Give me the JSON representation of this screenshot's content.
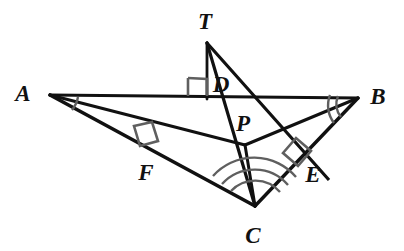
{
  "figure": {
    "type": "geometry-diagram",
    "background_color": "#ffffff",
    "stroke_color": "#111111",
    "mark_color": "#5a5a5a",
    "points": {
      "A": {
        "label": "A",
        "x": 50,
        "y": 95,
        "label_x": 23,
        "label_y": 101
      },
      "B": {
        "label": "B",
        "x": 358,
        "y": 98,
        "label_x": 368,
        "label_y": 104
      },
      "C": {
        "label": "C",
        "x": 255,
        "y": 206,
        "label_x": 245,
        "label_y": 240
      },
      "T": {
        "label": "T",
        "x": 207,
        "y": 43,
        "label_x": 198,
        "label_y": 27
      },
      "D": {
        "label": "D",
        "x": 207,
        "y": 96,
        "label_x": 213,
        "label_y": 91
      },
      "E": {
        "label": "E",
        "x": 305,
        "y": 154,
        "label_x": 305,
        "label_y": 181
      },
      "F": {
        "label": "F",
        "x": 153,
        "y": 151,
        "label_x": 137,
        "label_y": 179
      },
      "P": {
        "label": "P",
        "x": 245,
        "y": 145,
        "label_x": 234,
        "label_y": 131
      }
    },
    "segments": [
      {
        "name": "A-B",
        "from": "A",
        "to": "B"
      },
      {
        "name": "A-C",
        "from": "A",
        "to": "C"
      },
      {
        "name": "B-C",
        "from": "B",
        "to": "C"
      },
      {
        "name": "A-P",
        "from": "A",
        "to": "P"
      },
      {
        "name": "B-P",
        "from": "B",
        "to": "P"
      },
      {
        "name": "C-P",
        "from": "C",
        "to": "P"
      },
      {
        "name": "T-D",
        "from": "T",
        "to": "D"
      },
      {
        "name": "T-F-C",
        "from": "T",
        "to": "C",
        "through": "F"
      },
      {
        "name": "T-E-C",
        "from": "T",
        "to": "C",
        "through": "E"
      }
    ],
    "angle_marks": [
      {
        "name": "angle-mark-A",
        "vertex": "A",
        "arcs": 1
      },
      {
        "name": "angle-mark-B",
        "vertex": "B",
        "arcs": 2
      },
      {
        "name": "angle-mark-C",
        "vertex": "C",
        "arcs": 3
      }
    ],
    "right_angle_marks": [
      {
        "name": "right-angle-D",
        "at": "D"
      },
      {
        "name": "right-angle-F",
        "at": "F"
      },
      {
        "name": "right-angle-E",
        "at": "E"
      }
    ]
  }
}
